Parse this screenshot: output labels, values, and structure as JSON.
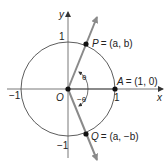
{
  "diagram": {
    "type": "unit-circle",
    "axes": {
      "x_label": "x",
      "y_label": "y",
      "origin_label": "O"
    },
    "ticks": {
      "x_pos": "1",
      "x_neg": "−1",
      "y_pos": "1",
      "y_neg": "−1"
    },
    "points": {
      "P": {
        "name": "P",
        "coords": "= (a, b)"
      },
      "A": {
        "name": "A",
        "coords": "= (1, 0)"
      },
      "Q": {
        "name": "Q",
        "coords": "= (a, −b)"
      }
    },
    "angles": {
      "theta": "θ",
      "neg_theta": "−θ"
    },
    "colors": {
      "ray": "#8a8a8a",
      "circle": "#333333",
      "axis": "#555555",
      "point": "#111111"
    }
  }
}
